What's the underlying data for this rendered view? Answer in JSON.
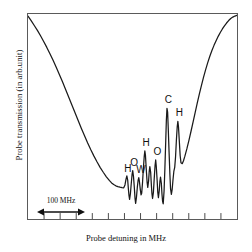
{
  "chart_data": {
    "type": "line",
    "title": "",
    "xlabel": "Probe detuning in MHz",
    "ylabel": "Probe transmission (in arb.unit)",
    "grid": false,
    "legend": null,
    "xlim": [
      0,
      100
    ],
    "ylim": [
      0,
      100
    ],
    "x_tick_count": 12,
    "x_tick_labels": [],
    "y_tick_labels": [],
    "scale_bar": {
      "label": "100 MHz",
      "span_x": [
        4,
        23
      ]
    },
    "series": [
      {
        "name": "probe transmission",
        "color": "#1a1a1a",
        "comment": "Doppler-broadened absorption dip with saturated-absorption (Lamb dip) hyperfine and crossover peaks near line centre",
        "points": [
          [
            0.0,
            99.0
          ],
          [
            1.5,
            96.8
          ],
          [
            3.0,
            94.4
          ],
          [
            4.5,
            92.0
          ],
          [
            6.0,
            89.4
          ],
          [
            7.5,
            86.6
          ],
          [
            9.0,
            83.7
          ],
          [
            10.5,
            80.6
          ],
          [
            12.0,
            77.4
          ],
          [
            13.5,
            74.0
          ],
          [
            15.0,
            70.5
          ],
          [
            16.5,
            66.9
          ],
          [
            18.0,
            63.2
          ],
          [
            19.5,
            59.4
          ],
          [
            21.0,
            55.6
          ],
          [
            22.5,
            51.8
          ],
          [
            24.0,
            48.0
          ],
          [
            25.5,
            44.3
          ],
          [
            27.0,
            40.7
          ],
          [
            28.5,
            37.2
          ],
          [
            30.0,
            33.9
          ],
          [
            31.5,
            30.8
          ],
          [
            33.0,
            27.9
          ],
          [
            34.5,
            25.2
          ],
          [
            36.0,
            22.8
          ],
          [
            37.5,
            20.6
          ],
          [
            39.0,
            18.7
          ],
          [
            40.0,
            17.6
          ],
          [
            41.0,
            16.8
          ],
          [
            42.0,
            16.2
          ],
          [
            43.0,
            15.8
          ],
          [
            44.0,
            15.5
          ],
          [
            45.0,
            15.3
          ],
          [
            45.8,
            15.2
          ],
          [
            46.4,
            16.6
          ],
          [
            46.9,
            19.4
          ],
          [
            47.3,
            21.0
          ],
          [
            47.7,
            19.0
          ],
          [
            48.0,
            15.0
          ],
          [
            48.3,
            11.6
          ],
          [
            48.6,
            9.6
          ],
          [
            49.0,
            12.4
          ],
          [
            49.4,
            17.2
          ],
          [
            49.8,
            21.8
          ],
          [
            50.1,
            23.6
          ],
          [
            50.5,
            20.4
          ],
          [
            50.9,
            15.0
          ],
          [
            51.2,
            10.2
          ],
          [
            51.5,
            7.6
          ],
          [
            51.9,
            10.6
          ],
          [
            52.3,
            15.4
          ],
          [
            52.7,
            19.0
          ],
          [
            53.0,
            20.2
          ],
          [
            53.3,
            18.4
          ],
          [
            53.7,
            14.6
          ],
          [
            54.1,
            11.8
          ],
          [
            54.4,
            12.6
          ],
          [
            54.8,
            17.8
          ],
          [
            55.2,
            24.6
          ],
          [
            55.6,
            30.4
          ],
          [
            55.9,
            33.2
          ],
          [
            56.2,
            31.0
          ],
          [
            56.6,
            24.0
          ],
          [
            57.0,
            17.8
          ],
          [
            57.3,
            15.4
          ],
          [
            57.7,
            18.6
          ],
          [
            58.0,
            23.2
          ],
          [
            58.3,
            25.6
          ],
          [
            58.7,
            22.6
          ],
          [
            59.0,
            17.0
          ],
          [
            59.3,
            12.4
          ],
          [
            59.6,
            10.0
          ],
          [
            60.0,
            13.0
          ],
          [
            60.4,
            19.8
          ],
          [
            60.8,
            26.2
          ],
          [
            61.1,
            28.8
          ],
          [
            61.4,
            25.4
          ],
          [
            61.8,
            18.6
          ],
          [
            62.1,
            13.0
          ],
          [
            62.4,
            10.4
          ],
          [
            62.8,
            13.8
          ],
          [
            63.1,
            18.2
          ],
          [
            63.4,
            20.4
          ],
          [
            63.8,
            17.4
          ],
          [
            64.1,
            12.2
          ],
          [
            64.4,
            8.6
          ],
          [
            64.7,
            7.4
          ],
          [
            65.1,
            13.6
          ],
          [
            65.5,
            24.8
          ],
          [
            65.9,
            38.0
          ],
          [
            66.2,
            48.2
          ],
          [
            66.5,
            54.0
          ],
          [
            66.8,
            52.2
          ],
          [
            67.1,
            44.4
          ],
          [
            67.5,
            32.6
          ],
          [
            67.9,
            21.6
          ],
          [
            68.2,
            14.8
          ],
          [
            68.6,
            12.0
          ],
          [
            69.0,
            14.6
          ],
          [
            69.4,
            19.4
          ],
          [
            69.8,
            23.4
          ],
          [
            70.2,
            25.2
          ],
          [
            70.6,
            30.4
          ],
          [
            71.0,
            38.4
          ],
          [
            71.4,
            45.0
          ],
          [
            71.7,
            47.6
          ],
          [
            72.0,
            45.0
          ],
          [
            72.4,
            38.0
          ],
          [
            72.8,
            31.0
          ],
          [
            73.2,
            27.4
          ],
          [
            73.8,
            27.0
          ],
          [
            74.4,
            28.4
          ],
          [
            75.0,
            30.4
          ],
          [
            76.0,
            34.2
          ],
          [
            77.0,
            38.4
          ],
          [
            78.0,
            42.8
          ],
          [
            79.0,
            47.4
          ],
          [
            80.0,
            52.0
          ],
          [
            81.0,
            56.6
          ],
          [
            82.0,
            61.0
          ],
          [
            83.0,
            65.2
          ],
          [
            84.0,
            69.2
          ],
          [
            85.0,
            72.9
          ],
          [
            86.0,
            76.3
          ],
          [
            87.0,
            79.4
          ],
          [
            88.0,
            82.2
          ],
          [
            89.0,
            84.7
          ],
          [
            90.0,
            87.0
          ],
          [
            91.0,
            89.1
          ],
          [
            92.0,
            91.0
          ],
          [
            93.0,
            92.7
          ],
          [
            94.0,
            94.2
          ],
          [
            95.0,
            95.6
          ],
          [
            96.0,
            96.8
          ],
          [
            97.0,
            97.8
          ],
          [
            98.0,
            98.5
          ],
          [
            99.0,
            99.0
          ],
          [
            100.0,
            99.4
          ]
        ]
      }
    ],
    "annotations": [
      {
        "id": "peak-h-1",
        "text": "H",
        "x": 47.3,
        "y": 21.0
      },
      {
        "id": "peak-o-1",
        "text": "O",
        "x": 50.1,
        "y": 23.6
      },
      {
        "id": "peak-w-1",
        "text": "W",
        "x": 53.0,
        "y": 20.2
      },
      {
        "id": "peak-h-2",
        "text": "H",
        "x": 55.9,
        "y": 33.2
      },
      {
        "id": "peak-o-2",
        "text": "O",
        "x": 61.1,
        "y": 28.8
      },
      {
        "id": "peak-c-1",
        "text": "C",
        "x": 66.5,
        "y": 54.0
      },
      {
        "id": "peak-h-3",
        "text": "H",
        "x": 71.7,
        "y": 47.6
      }
    ]
  },
  "axes": {
    "xlabel": "Probe detuning in MHz",
    "ylabel": "Probe transmission (in arb.unit)"
  },
  "scale_bar": {
    "label": "100 MHz"
  },
  "peaks": [
    {
      "label": "H"
    },
    {
      "label": "O"
    },
    {
      "label": "W"
    },
    {
      "label": "H"
    },
    {
      "label": "O"
    },
    {
      "label": "C"
    },
    {
      "label": "H"
    }
  ],
  "colors": {
    "curve": "#1a1a1a",
    "frame": "#5a5a5a",
    "background": "#ffffff",
    "text": "#111111"
  }
}
